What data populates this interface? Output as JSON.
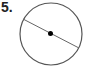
{
  "problem": {
    "number_label": "5."
  },
  "figure": {
    "type": "circle-with-diameter",
    "center": [
      51,
      34
    ],
    "radius": 31,
    "diameter_endpoints": [
      [
        23,
        18
      ],
      [
        79,
        48
      ]
    ],
    "stroke_color": "#555555",
    "center_dot_color": "#000000"
  }
}
